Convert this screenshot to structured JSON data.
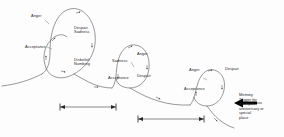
{
  "figure": {
    "background_color": "#fdfdfd",
    "line_color": "#555555",
    "text_color": "#2a2a2a",
    "arrow_fill": "#000000"
  },
  "loops": [
    {
      "id": "loop-1",
      "size": "large",
      "labels": {
        "anger": "Anger",
        "despair_sadness": "Despair\nSadness",
        "acceptance": "Acceptance",
        "disbelief_numbing": "Disbelief\nNumbing"
      }
    },
    {
      "id": "loop-2",
      "size": "medium",
      "labels": {
        "anger": "Anger",
        "sadness": "Sadness",
        "despair": "Despair",
        "acceptance": "Acceptance"
      }
    },
    {
      "id": "loop-3",
      "size": "small",
      "labels": {
        "anger": "Anger",
        "despair": "Despair",
        "acceptance": "Acceptance"
      }
    }
  ],
  "annotations": {
    "memory_trigger": "Memory\nTrigger for\nexample,\nanniversary or\nspecial\nplace"
  },
  "span_bars": [
    {
      "id": "span-1",
      "label": ""
    },
    {
      "id": "span-2",
      "label": ""
    }
  ],
  "icons": {
    "trigger_arrow": "left-arrow-icon",
    "span_marker": "span-endpoint-icon",
    "flow_arrow": "flow-direction-arrow-icon"
  }
}
